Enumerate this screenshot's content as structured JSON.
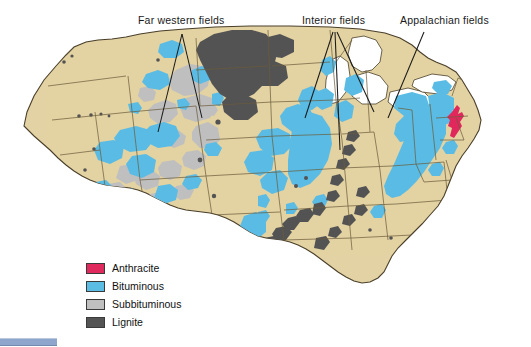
{
  "map": {
    "title": "United States coal fields map",
    "colors": {
      "land": "#e3d2a3",
      "land_shadow": "#d8c695",
      "water": "#ffffff",
      "border": "#4a3f2a",
      "state_border": "#6b5c3c",
      "anthracite": "#e0295c",
      "bituminous": "#5bbce4",
      "subbituminous": "#bfbfbf",
      "lignite": "#545454",
      "leader_line": "#1a1a1a",
      "background": "#ffffff",
      "bottom_bar": "#8ea6cc"
    }
  },
  "annotations": [
    {
      "id": "far-western",
      "label": "Far western fields"
    },
    {
      "id": "interior",
      "label": "Interior fields"
    },
    {
      "id": "appalachian",
      "label": "Appalachian fields"
    }
  ],
  "legend": {
    "items": [
      {
        "label": "Anthracite",
        "color": "#e0295c"
      },
      {
        "label": "Bituminous",
        "color": "#5bbce4"
      },
      {
        "label": "Subbituminous",
        "color": "#bfbfbf"
      },
      {
        "label": "Lignite",
        "color": "#545454"
      }
    ]
  }
}
